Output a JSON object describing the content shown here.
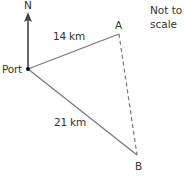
{
  "diagram": {
    "type": "bearing-triangle",
    "note": {
      "line1": "Not to",
      "line2": "scale"
    },
    "north_label": "N",
    "points": {
      "port": {
        "label": "Port",
        "x": 28,
        "y": 69
      },
      "A": {
        "label": "A",
        "x": 119,
        "y": 34
      },
      "B": {
        "label": "B",
        "x": 137,
        "y": 155
      }
    },
    "edges": [
      {
        "from": "Port",
        "to": "A",
        "label": "14 km",
        "style": "solid"
      },
      {
        "from": "Port",
        "to": "B",
        "label": "21 km",
        "style": "solid"
      },
      {
        "from": "A",
        "to": "B",
        "label": "",
        "style": "dashed"
      }
    ],
    "colors": {
      "line": "#777777",
      "arrow": "#444444",
      "text": "#333333",
      "dot": "#111111"
    }
  }
}
